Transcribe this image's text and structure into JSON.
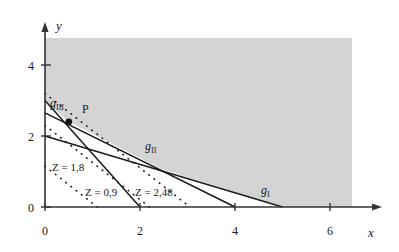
{
  "figure": {
    "background_color": "#ffffff",
    "shade_color": "#d4d4d4",
    "line_color": "#1a1a1a"
  },
  "axes": {
    "x_axis_label": "x",
    "y_axis_label": "y",
    "x_ticks": [
      {
        "value": 0,
        "label": "0"
      },
      {
        "value": 2,
        "label": "2"
      },
      {
        "value": 4,
        "label": "4"
      },
      {
        "value": 6,
        "label": "6"
      }
    ],
    "y_ticks": [
      {
        "value": 0,
        "label": "0"
      },
      {
        "value": 2,
        "label": "2"
      },
      {
        "value": 4,
        "label": "4"
      }
    ],
    "x_range": [
      0,
      7.0
    ],
    "y_range": [
      0,
      5.0
    ],
    "grid": false
  },
  "point": {
    "name": "P",
    "label": "P",
    "x": 0.5,
    "y": 2.4
  },
  "constraints": [
    {
      "id": "gI",
      "label": "g",
      "subscript": "I",
      "x_intercept": 5.0,
      "y_intercept": 2.0,
      "label_x": 4.55,
      "label_y": 0.65
    },
    {
      "id": "gII",
      "label": "g",
      "subscript": "II",
      "x_intercept": 4.0,
      "y_intercept": 2.65,
      "label_x": 2.1,
      "label_y": 1.53
    },
    {
      "id": "gIII",
      "label": "g",
      "subscript": "III",
      "x_intercept": 2.0,
      "y_intercept": 3.0,
      "label_x": 0.12,
      "label_y": 2.82
    }
  ],
  "objective_lines": [
    {
      "id": "z-09",
      "label": "Z = 0,9",
      "value": "0,9",
      "x_intercept": 1.1,
      "y_intercept": 1.15,
      "label_x": 0.85,
      "label_y": 0.48
    },
    {
      "id": "z-18",
      "label": "Z = 1,8",
      "value": "1,8",
      "x_intercept": 2.2,
      "y_intercept": 2.3,
      "label_x": 0.15,
      "label_y": 1.12
    },
    {
      "id": "z-248",
      "label": "Z = 2,48",
      "value": "2,48",
      "x_intercept": 3.05,
      "y_intercept": 3.2,
      "label_x": 1.9,
      "label_y": 0.48
    }
  ],
  "feasible_region": {
    "name": "feasible-region",
    "description": "shaded admissible region bounded below by the constraint lines"
  }
}
